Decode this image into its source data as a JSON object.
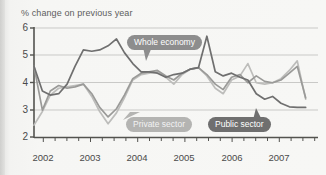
{
  "chart_data": {
    "type": "line",
    "title": "% change on previous year",
    "xlabel": "",
    "ylabel": "",
    "ylim": [
      2,
      6
    ],
    "yticks": [
      2,
      3,
      4,
      5,
      6
    ],
    "xlim": [
      2001.5,
      2007.25
    ],
    "xticks": [
      2002,
      2003,
      2004,
      2005,
      2006,
      2007
    ],
    "xtick_labels": [
      "2002",
      "2003",
      "2004",
      "2005",
      "2006",
      "2007"
    ],
    "grid": true,
    "legend_position": "inline-callouts",
    "x": [
      2001.5,
      2001.67,
      2001.83,
      2002.0,
      2002.17,
      2002.33,
      2002.5,
      2002.67,
      2002.83,
      2003.0,
      2003.17,
      2003.33,
      2003.5,
      2003.67,
      2003.83,
      2004.0,
      2004.17,
      2004.33,
      2004.5,
      2004.67,
      2004.83,
      2005.0,
      2005.17,
      2005.33,
      2005.5,
      2005.67,
      2005.83,
      2006.0,
      2006.17,
      2006.33,
      2006.5,
      2006.67,
      2006.83,
      2007.0
    ],
    "series": [
      {
        "name": "Whole economy",
        "color": "#9a9a98",
        "values": [
          4.6,
          3.0,
          3.7,
          3.9,
          3.8,
          3.85,
          3.95,
          3.6,
          3.1,
          2.75,
          3.05,
          3.55,
          4.15,
          4.35,
          4.4,
          4.45,
          4.25,
          4.1,
          4.35,
          4.5,
          4.55,
          4.3,
          3.95,
          3.75,
          4.2,
          4.3,
          4.0,
          4.25,
          4.05,
          4.0,
          4.1,
          4.35,
          4.6,
          3.45
        ]
      },
      {
        "name": "Private sector",
        "color": "#bdbdbb",
        "values": [
          2.45,
          2.95,
          3.55,
          3.8,
          3.85,
          3.9,
          3.95,
          3.5,
          2.95,
          2.5,
          2.9,
          3.45,
          4.1,
          4.3,
          4.35,
          4.4,
          4.2,
          3.95,
          4.3,
          4.5,
          4.55,
          4.25,
          3.8,
          3.6,
          4.1,
          4.25,
          4.7,
          4.0,
          3.95,
          4.0,
          4.15,
          4.45,
          4.8,
          3.4
        ]
      },
      {
        "name": "Public sector",
        "color": "#6f6f6f",
        "values": [
          4.6,
          3.7,
          3.55,
          3.6,
          3.95,
          4.6,
          5.2,
          5.15,
          5.2,
          5.35,
          5.6,
          5.1,
          4.7,
          4.4,
          4.4,
          4.35,
          4.2,
          4.3,
          4.35,
          4.5,
          4.55,
          5.7,
          4.4,
          4.25,
          4.35,
          4.2,
          4.1,
          3.6,
          3.4,
          3.5,
          3.25,
          3.12,
          3.1,
          3.1
        ]
      }
    ],
    "annotations": [
      {
        "label": "Whole economy",
        "style": "callout-dark"
      },
      {
        "label": "Private sector",
        "style": "callout-light"
      },
      {
        "label": "Public sector",
        "style": "callout-mid"
      }
    ]
  }
}
